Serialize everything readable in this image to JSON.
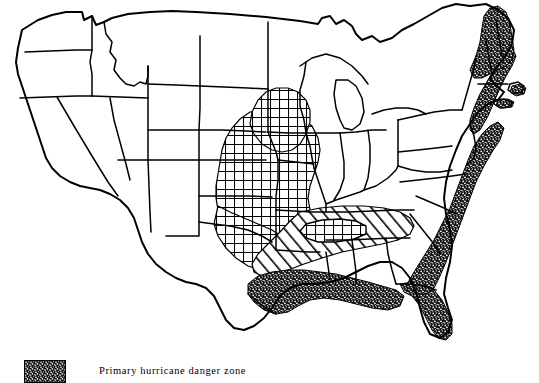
{
  "map": {
    "title": "United States hazard zone map",
    "description": "Outline map of the contiguous United States with state boundaries, showing three shaded hazard zones.",
    "colors": {
      "outline": "#000000",
      "background": "#ffffff",
      "stipple": "#1a1a1a",
      "hatch": "#000000",
      "grid": "#000000"
    },
    "zones": [
      {
        "id": "primary-hurricane-danger-zone",
        "pattern": "stipple",
        "label": "Primary hurricane danger zone",
        "region": "Atlantic and Gulf coastal band from Maine south through Florida and west along the Gulf Coast to Texas"
      },
      {
        "id": "tornado-zone",
        "pattern": "crosshatch-grid",
        "label": "",
        "region": "Central plains and midwest: Kansas, Oklahoma, Nebraska, Iowa, Missouri, Illinois, Indiana, northern Texas"
      },
      {
        "id": "secondary-zone",
        "pattern": "diagonal-hatch",
        "label": "",
        "region": "Tennessee, Kentucky, Arkansas, northern Mississippi, Alabama and Georgia interior"
      }
    ]
  },
  "legend": {
    "items": [
      {
        "swatch": "stipple-swatch",
        "label": "Primary  hurricane  danger  zone"
      }
    ]
  }
}
